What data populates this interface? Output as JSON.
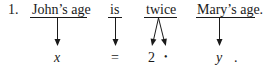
{
  "example_number": "1.",
  "words": [
    {
      "text": "John's age",
      "maps_to": "x"
    },
    {
      "text": "is",
      "maps_to": "="
    },
    {
      "text": "twice",
      "maps_to": [
        "2",
        "•"
      ]
    },
    {
      "text": "Mary's age.",
      "maps_to": "y"
    }
  ],
  "symbols": {
    "x": "x",
    "eq": "=",
    "two": "2",
    "times": "•",
    "y": "y",
    "period": "."
  },
  "labels": {
    "w1": "John’s age",
    "w2": "is",
    "w3": "twice",
    "w4": "Mary’s age."
  }
}
